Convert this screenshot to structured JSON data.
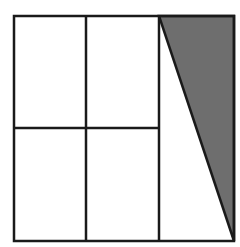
{
  "diagram": {
    "colors": {
      "background": "#ffffff",
      "stroke": "#1a1a1a",
      "shade": "#6e6e6e"
    },
    "square": {
      "x1": 14,
      "y1": 16,
      "x2": 234,
      "y2": 241
    },
    "vertical_lines": [
      86,
      159
    ],
    "horizontal_line": {
      "y": 128,
      "x1": 14,
      "x2": 159
    },
    "shaded_triangle": [
      [
        159,
        16
      ],
      [
        234,
        16
      ],
      [
        234,
        241
      ]
    ]
  }
}
